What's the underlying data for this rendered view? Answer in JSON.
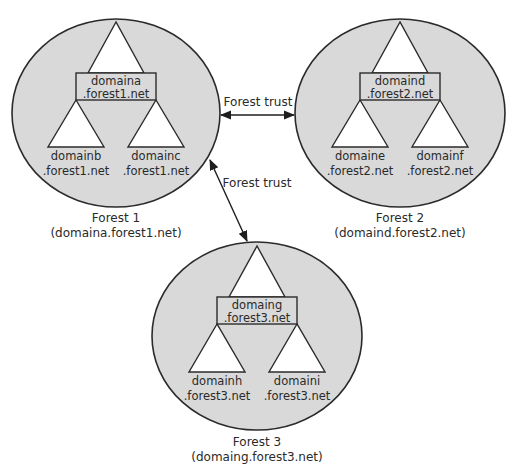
{
  "diagram": {
    "type": "active-directory-forest-trusts",
    "colors": {
      "forest_fill": "#d9d9d9",
      "domain_fill": "#ffffff",
      "stroke": "#2b2b2b"
    },
    "forests": [
      {
        "id": "forest1",
        "caption": "Forest 1",
        "root": "(domaina.forest1.net)",
        "domains": {
          "root": {
            "name": "domaina",
            "suffix": ".forest1.net"
          },
          "left": {
            "name": "domainb",
            "suffix": ".forest1.net"
          },
          "right": {
            "name": "domainc",
            "suffix": ".forest1.net"
          }
        }
      },
      {
        "id": "forest2",
        "caption": "Forest 2",
        "root": "(domaind.forest2.net)",
        "domains": {
          "root": {
            "name": "domaind",
            "suffix": ".forest2.net"
          },
          "left": {
            "name": "domaine",
            "suffix": ".forest2.net"
          },
          "right": {
            "name": "domainf",
            "suffix": ".forest2.net"
          }
        }
      },
      {
        "id": "forest3",
        "caption": "Forest 3",
        "root": "(domaing.forest3.net)",
        "domains": {
          "root": {
            "name": "domaing",
            "suffix": ".forest3.net"
          },
          "left": {
            "name": "domainh",
            "suffix": ".forest3.net"
          },
          "right": {
            "name": "domaini",
            "suffix": ".forest3.net"
          }
        }
      }
    ],
    "trusts": [
      {
        "label": "Forest trust",
        "from": "forest1",
        "to": "forest2",
        "direction": "bidirectional"
      },
      {
        "label": "Forest trust",
        "from": "forest1",
        "to": "forest3",
        "direction": "bidirectional"
      }
    ]
  }
}
